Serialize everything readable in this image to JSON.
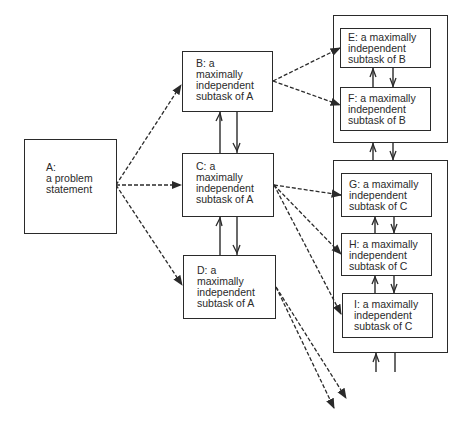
{
  "diagram": {
    "type": "task-decomposition",
    "nodes": [
      {
        "id": "A",
        "text": "A:\na problem\nstatement"
      },
      {
        "id": "B",
        "text": "B: a\nmaximally\nindependent\nsubtask of A"
      },
      {
        "id": "C",
        "text": "C: a\nmaximally\nindependent\nsubtask of A"
      },
      {
        "id": "D",
        "text": "D: a\nmaximally\nindependent\nsubtask of A"
      },
      {
        "id": "E",
        "text": "E: a maximally\nindependent\nsubtask of B"
      },
      {
        "id": "F",
        "text": "F: a maximally\nindependent\nsubtask of B"
      },
      {
        "id": "G",
        "text": "G: a maximally\nindependent\nsubtask of C"
      },
      {
        "id": "H",
        "text": "H: a maximally\nindependent\nsubtask of C"
      },
      {
        "id": "I",
        "text": "I: a maximally\nindependent\nsubtask of C"
      }
    ],
    "groups": [
      {
        "id": "group-B",
        "members": [
          "E",
          "F"
        ]
      },
      {
        "id": "group-C",
        "members": [
          "G",
          "H",
          "I"
        ]
      }
    ],
    "dashed_edges": [
      {
        "from": "A",
        "to": "B"
      },
      {
        "from": "A",
        "to": "C"
      },
      {
        "from": "A",
        "to": "D"
      },
      {
        "from": "B",
        "to": "E"
      },
      {
        "from": "B",
        "to": "F"
      },
      {
        "from": "C",
        "to": "G"
      },
      {
        "from": "C",
        "to": "H"
      },
      {
        "from": "C",
        "to": "I"
      },
      {
        "from": "D",
        "to": "offscreen-1"
      },
      {
        "from": "D",
        "to": "offscreen-2"
      }
    ],
    "bidirectional_links": [
      {
        "between": [
          "B",
          "C"
        ]
      },
      {
        "between": [
          "C",
          "D"
        ]
      },
      {
        "between": [
          "E",
          "F"
        ]
      },
      {
        "between": [
          "group-B",
          "group-C"
        ]
      },
      {
        "between": [
          "G",
          "H"
        ]
      },
      {
        "between": [
          "H",
          "I"
        ]
      },
      {
        "between": [
          "group-C",
          "below"
        ]
      }
    ]
  }
}
